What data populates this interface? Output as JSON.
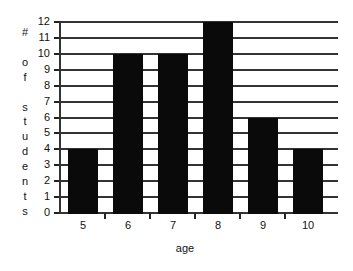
{
  "chart_data": {
    "type": "bar",
    "title": "",
    "xlabel": "age",
    "ylabel": "# of students",
    "categories": [
      "5",
      "6",
      "7",
      "8",
      "9",
      "10"
    ],
    "values": [
      4,
      10,
      10,
      12,
      6,
      4
    ],
    "ylim": [
      0,
      12
    ],
    "yticks": [
      0,
      1,
      2,
      3,
      4,
      5,
      6,
      7,
      8,
      9,
      10,
      11,
      12
    ],
    "grid": true,
    "legend": null,
    "bar_color": "#0a0a0a"
  },
  "ylabel_chars": [
    "#",
    "",
    "o",
    "f",
    "",
    "s",
    "t",
    "u",
    "d",
    "e",
    "n",
    "t",
    "s"
  ]
}
